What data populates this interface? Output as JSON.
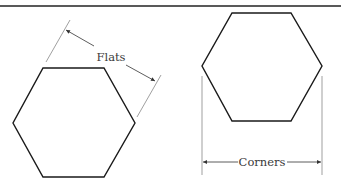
{
  "diagram": {
    "labels": {
      "flats": "Flats",
      "corners": "Corners"
    },
    "colors": {
      "stroke": "#1a1a1a",
      "dimension": "#555555",
      "text": "#3a3a3a",
      "rule": "#222222"
    },
    "shapes": [
      {
        "name": "hexagon-flats",
        "points": "43,68 104,68 135,123 104,177 43,177 13,123"
      },
      {
        "name": "hexagon-corners",
        "points": "232,13 291,13 322,66 291,121 232,121 202,66"
      }
    ]
  }
}
